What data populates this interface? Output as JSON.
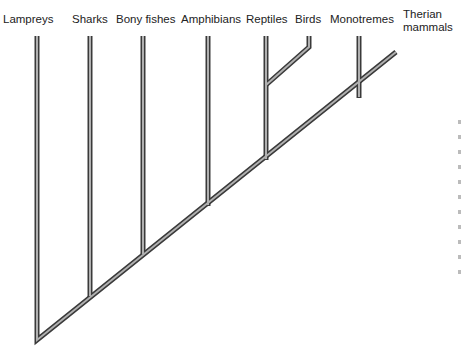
{
  "diagram": {
    "type": "cladogram",
    "title": "",
    "taxa": [
      {
        "id": "lampreys",
        "label": "Lampreys",
        "label_x": 3,
        "label_y": 19,
        "branch_x": 37,
        "join_y": 340
      },
      {
        "id": "sharks",
        "label": "Sharks",
        "label_x": 72,
        "label_y": 19,
        "branch_x": 90,
        "join_y": 293
      },
      {
        "id": "bony-fishes",
        "label": "Bony fishes",
        "label_x": 116,
        "label_y": 19,
        "branch_x": 143,
        "join_y": 251
      },
      {
        "id": "amphibians",
        "label": "Amphibians",
        "label_x": 181,
        "label_y": 19,
        "branch_x": 208,
        "join_y": 203
      },
      {
        "id": "reptiles",
        "label": "Reptiles",
        "label_x": 246,
        "label_y": 19,
        "branch_x": 266,
        "join_y": 158
      },
      {
        "id": "birds",
        "label": "Birds",
        "label_x": 294,
        "label_y": 19,
        "branch_x": 309,
        "join_y": 85
      },
      {
        "id": "monotremes",
        "label": "Monotremes",
        "label_x": 330,
        "label_y": 19,
        "branch_x": 359,
        "join_y": 95
      },
      {
        "id": "therian-mammals",
        "label": "Therian\nmammals",
        "label_line1": "Therian",
        "label_line2": "mammals",
        "label_x": 403,
        "label_y": 14
      }
    ],
    "trunk": {
      "start": [
        37,
        340
      ],
      "end": [
        396,
        52
      ]
    },
    "top_y": 36,
    "colors": {
      "branch_outline": "#3a3a3a",
      "branch_fill": "#a8a8a8",
      "text": "#222222",
      "background": "#ffffff"
    }
  }
}
